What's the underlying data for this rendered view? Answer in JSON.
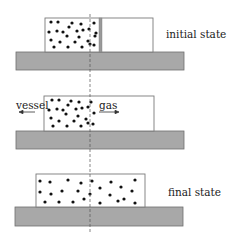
{
  "figure": {
    "kind": "free-expansion-schematic",
    "colors": {
      "platform_fill": "#a8a8a8",
      "platform_stroke": "#6e6e6e",
      "box_stroke": "#7a7a7a",
      "partition_fill": "#9a9a9a",
      "dot": "#111111",
      "dashed_line": "#555555",
      "arrow": "#333333"
    },
    "panels": [
      {
        "id": "initial",
        "label": "initial state",
        "box": {
          "x": 45,
          "y": 18,
          "w": 108,
          "h": 34
        },
        "partition": {
          "x": 99,
          "w": 3
        },
        "platform": {
          "x": 16,
          "y": 52,
          "w": 168,
          "h": 18
        }
      },
      {
        "id": "middle",
        "labels": {
          "vessel": "vessel",
          "gas": "gas"
        },
        "box": {
          "x": 44,
          "y": 96,
          "w": 110,
          "h": 34
        },
        "platform": {
          "x": 16,
          "y": 131,
          "w": 168,
          "h": 18
        },
        "arrows": {
          "vessel": {
            "x1": 34,
            "x2": 20,
            "y": 112,
            "direction": "left"
          },
          "gas": {
            "x1": 99,
            "x2": 118,
            "y": 112,
            "direction": "right"
          }
        }
      },
      {
        "id": "final",
        "label": "final state",
        "box": {
          "x": 36,
          "y": 174,
          "w": 109,
          "h": 33
        },
        "platform": {
          "x": 15,
          "y": 207,
          "w": 168,
          "h": 19
        }
      }
    ],
    "dashed_reference_line": {
      "x": 90,
      "y1": 0,
      "y2": 239
    }
  }
}
